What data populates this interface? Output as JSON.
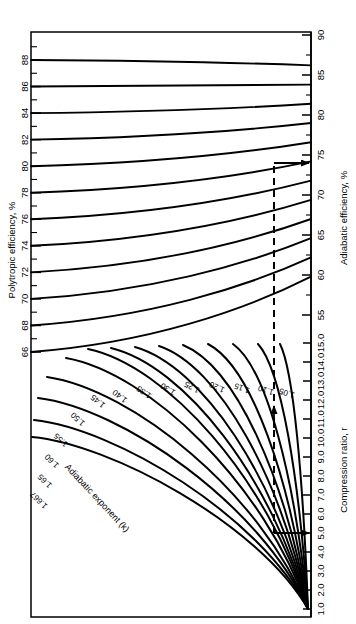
{
  "chart_data": {
    "type": "line",
    "orientation_note": "figure is printed rotated 90 degrees (clockwise) on the page",
    "xlabel": "Adiabatic efficiency, %",
    "ylabel": "Compression ratio, r",
    "secondary_axis_label": "Polytropic efficiency, %",
    "family_label": "Adiabatic exponent (k)",
    "axes": {
      "adiabatic_efficiency": {
        "label": "Adiabatic efficiency, %",
        "ticks": [
          55,
          60,
          65,
          70,
          75,
          80,
          85,
          90
        ],
        "tick_labels": [
          "55",
          "60",
          "65",
          "70",
          "75",
          "80",
          "85",
          "90"
        ],
        "range": [
          52,
          90
        ]
      },
      "polytropic_efficiency": {
        "label": "Polytropic efficiency, %",
        "ticks": [
          66,
          68,
          70,
          72,
          74,
          76,
          78,
          80,
          82,
          84,
          86,
          88
        ],
        "tick_labels": [
          "66",
          "68",
          "70",
          "72",
          "74",
          "76",
          "78",
          "80",
          "82",
          "84",
          "86",
          "88"
        ],
        "range": [
          66,
          90
        ]
      },
      "compression_ratio": {
        "label": "Compression ratio, r",
        "ticks": [
          1.0,
          2.0,
          3.0,
          4.0,
          5.0,
          6.0,
          7.0,
          8.0,
          9.0,
          10.0,
          11.0,
          12.0,
          13.0,
          14.0,
          15.0
        ],
        "tick_labels": [
          "1.0",
          "2.0",
          "3.0",
          "4.0",
          "5.0",
          "6.0",
          "7.0",
          "8.0",
          "9.0",
          "10.0",
          "11.0",
          "12.0",
          "13.0",
          "14.0",
          "15.0"
        ],
        "range": [
          1.0,
          15.5
        ]
      }
    },
    "polytropic_curve_labels": [
      "66",
      "68",
      "70",
      "72",
      "74",
      "76",
      "78",
      "80",
      "82",
      "84",
      "86",
      "88"
    ],
    "adiabatic_exponent_labels": [
      "1.05",
      "1.10",
      "1.15",
      "1.20",
      "1.25",
      "1.30",
      "1.35",
      "1.40",
      "1.45",
      "1.50",
      "1.55",
      "1.60",
      "1.65",
      "1.667"
    ],
    "series": [
      {
        "name": "88",
        "note": "polytropic efficiency 88%",
        "adiabatic_start": 88,
        "adiabatic_end": 86.2
      },
      {
        "name": "86",
        "note": "polytropic efficiency 86%",
        "adiabatic_start": 86,
        "adiabatic_end": 83.8
      },
      {
        "name": "84",
        "note": "polytropic efficiency 84%",
        "adiabatic_start": 84,
        "adiabatic_end": 81.4
      },
      {
        "name": "82",
        "note": "polytropic efficiency 82%",
        "adiabatic_start": 82,
        "adiabatic_end": 79.0
      },
      {
        "name": "80",
        "note": "polytropic efficiency 80%",
        "adiabatic_start": 80,
        "adiabatic_end": 76.6
      },
      {
        "name": "78",
        "note": "polytropic efficiency 78%",
        "adiabatic_start": 78,
        "adiabatic_end": 74.2
      },
      {
        "name": "76",
        "note": "polytropic efficiency 76%",
        "adiabatic_start": 76,
        "adiabatic_end": 71.8
      },
      {
        "name": "74",
        "note": "polytropic efficiency 74%",
        "adiabatic_start": 74,
        "adiabatic_end": 69.4
      },
      {
        "name": "72",
        "note": "polytropic efficiency 72%",
        "adiabatic_start": 72,
        "adiabatic_end": 67.0
      },
      {
        "name": "70",
        "note": "polytropic efficiency 70%",
        "adiabatic_start": 70,
        "adiabatic_end": 64.6
      },
      {
        "name": "68",
        "note": "polytropic efficiency 68%",
        "adiabatic_start": 68,
        "adiabatic_end": 62.2
      },
      {
        "name": "66",
        "note": "polytropic efficiency 66%",
        "adiabatic_start": 66,
        "adiabatic_end": 59.8
      }
    ],
    "construction_lines": {
      "style": "dashed vertical with solid horizontal arrows",
      "compression_ratio_entry": "5.0",
      "adiabatic_efficiency_result": "74",
      "arrow_in_label": "r = 5.0",
      "arrow_out_label": "adiabatic efficiency ≈ 74%"
    },
    "grid": false,
    "legend": "inline curve labels"
  },
  "labels": {
    "polytropic_axis_title": "Polytropic efficiency, %",
    "adiabatic_axis_title": "Adiabatic efficiency, %",
    "compression_axis_title": "Compression ratio, r",
    "exponent_family_title": "Adiabatic exponent (k)"
  },
  "polytropic_ticks": [
    "88",
    "86",
    "84",
    "82",
    "80",
    "78",
    "76",
    "74",
    "72",
    "70",
    "68",
    "66"
  ],
  "adiabatic_ticks": [
    "90",
    "85",
    "80",
    "75",
    "70",
    "65",
    "60",
    "55"
  ],
  "compression_ticks": [
    "15.0",
    "14.0",
    "13.0",
    "12.0",
    "11.0",
    "10.0",
    "9.0",
    "8.0",
    "7.0",
    "6.0",
    "5.0",
    "4.0",
    "3.0",
    "2.0",
    "1.0"
  ],
  "k_labels": [
    "1.05",
    "1.10",
    "1.15",
    "1.20",
    "1.25",
    "1.30",
    "1.35",
    "1.40",
    "1.45",
    "1.50",
    "1.55",
    "1.60",
    "1.65",
    "1.667"
  ]
}
